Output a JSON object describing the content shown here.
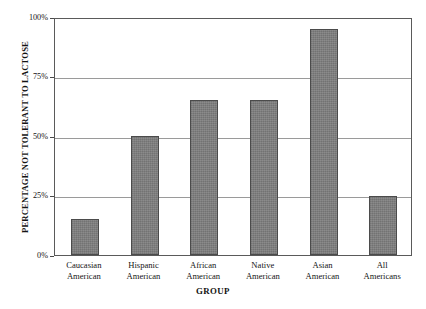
{
  "chart_data": {
    "type": "bar",
    "title": "",
    "xlabel": "GROUP",
    "ylabel": "PERCENTAGE NOT TOLERANT TO LACTOSE",
    "categories": [
      "Caucasian American",
      "Hispanic American",
      "African American",
      "Native American",
      "Asian American",
      "All Americans"
    ],
    "category_lines": [
      [
        "Caucasian",
        "American"
      ],
      [
        "Hispanic",
        "American"
      ],
      [
        "African",
        "American"
      ],
      [
        "Native",
        "American"
      ],
      [
        "Asian",
        "American"
      ],
      [
        "All",
        "Americans"
      ]
    ],
    "values": [
      15,
      50,
      65,
      65,
      95,
      25
    ],
    "ylim": [
      0,
      100
    ],
    "yticks": [
      0,
      25,
      50,
      75,
      100
    ],
    "ytick_labels": [
      "0%",
      "25%",
      "50%",
      "75%",
      "100%"
    ],
    "grid": true,
    "grid_axis": "y",
    "legend": false,
    "legend_position": "none",
    "bar_color": "#808080",
    "bar_edge_color": "#4b4b4b",
    "grid_color": "#9a9a9a",
    "frame_color": "#5a5a5a",
    "background_color": "#ffffff",
    "text_color": "#151515"
  }
}
